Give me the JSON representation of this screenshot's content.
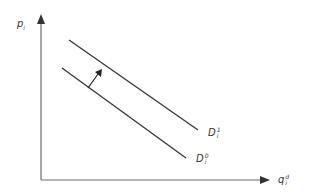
{
  "diagram": {
    "type": "economics-demand-shift",
    "colors": {
      "axis": "#6e6e6e",
      "line": "#3a3a3a",
      "arrow": "#222222",
      "text": "#333333"
    },
    "y_axis": {
      "label_main": "p",
      "label_sub": "i"
    },
    "x_axis": {
      "label_main": "q",
      "label_sup": "d",
      "label_sub": "i"
    },
    "curves": [
      {
        "name": "D1",
        "label_main": "D",
        "label_sup": "1",
        "label_sub": "i"
      },
      {
        "name": "D0",
        "label_main": "D",
        "label_sup": "0",
        "label_sub": "i"
      }
    ],
    "shift_arrow": {
      "direction": "outward (up-right)"
    }
  }
}
